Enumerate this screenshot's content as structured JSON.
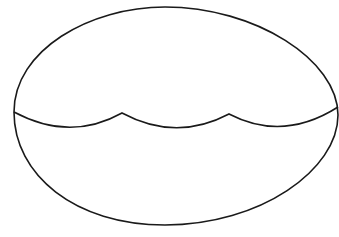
{
  "figure": {
    "stroke_color": "#1a1a1a",
    "background_color": "#ffffff",
    "shapes": {
      "egg_outline": {
        "left_point": [
          14,
          112
        ],
        "right_point": [
          338,
          115
        ],
        "top_point": [
          160,
          7
        ],
        "bottom_point": [
          160,
          225
        ]
      },
      "wavy_divider": {
        "start": [
          14,
          112
        ],
        "cusps": [
          [
            122,
            113
          ],
          [
            229,
            114
          ]
        ],
        "end": [
          338,
          107
        ],
        "trough_depth_y": 127
      }
    }
  }
}
